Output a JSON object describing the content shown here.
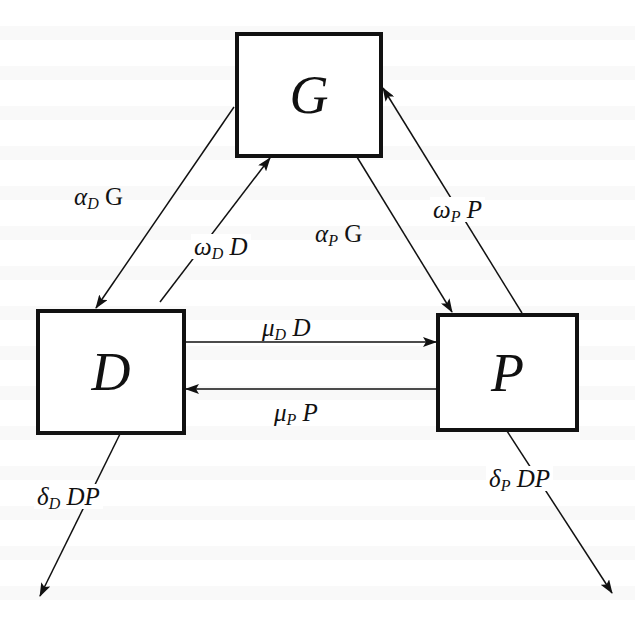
{
  "diagram": {
    "type": "compartment-flow",
    "colors": {
      "stroke": "#111111",
      "background": "#ffffff"
    },
    "nodes": [
      {
        "id": "G",
        "label": "G"
      },
      {
        "id": "D",
        "label": "D"
      },
      {
        "id": "P",
        "label": "P"
      }
    ],
    "edges": [
      {
        "from": "G",
        "to": "D",
        "greek": "α",
        "sub": "D",
        "term": "G"
      },
      {
        "from": "D",
        "to": "G",
        "greek": "ω",
        "sub": "D",
        "term": "D"
      },
      {
        "from": "G",
        "to": "P",
        "greek": "α",
        "sub": "P",
        "term": "G"
      },
      {
        "from": "P",
        "to": "G",
        "greek": "ω",
        "sub": "P",
        "term": "P"
      },
      {
        "from": "D",
        "to": "P",
        "greek": "μ",
        "sub": "D",
        "term": "D"
      },
      {
        "from": "P",
        "to": "D",
        "greek": "μ",
        "sub": "P",
        "term": "P"
      },
      {
        "from": "D",
        "to": "out",
        "greek": "δ",
        "sub": "D",
        "term": "DP"
      },
      {
        "from": "P",
        "to": "out",
        "greek": "δ",
        "sub": "P",
        "term": "DP"
      }
    ]
  }
}
